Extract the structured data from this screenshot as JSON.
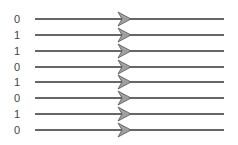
{
  "diagram": {
    "bits": [
      "0",
      "1",
      "1",
      "0",
      "1",
      "0",
      "1",
      "0"
    ],
    "line_y": [
      19,
      35,
      51,
      67,
      82,
      98,
      114,
      130
    ],
    "line_x_start": 35,
    "line_x_end": 224,
    "arrow_x": 118,
    "colors": {
      "line": "#333333",
      "arrow_fill": "#a0a0a0",
      "arrow_stroke": "#555555",
      "label": "#444444"
    }
  }
}
